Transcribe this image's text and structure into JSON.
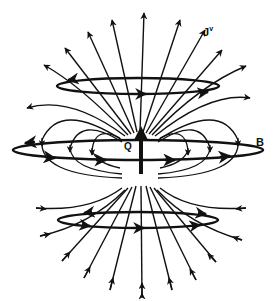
{
  "figure": {
    "type": "physics field diagram",
    "labels": {
      "current_density": "J",
      "current_density_superscript": "v",
      "magnetic_field": "B",
      "charge": "Q"
    },
    "colors": {
      "ink": "#111111",
      "background": "#ffffff"
    },
    "elements": {
      "central_ring": "horizontal ellipse around equator labeled B, with directional arrows",
      "upper_ring": "smaller horizontal ellipse above center with arrows",
      "lower_ring": "smaller horizontal ellipse below center with arrows",
      "charge_arrow": "thick upward arrow at center labeled Q",
      "top_lines": "radial field lines pointing outward from top (J^v)",
      "bottom_lines": "radial field lines pointing inward toward bottom",
      "side_loops": "curved loop field lines on left and right"
    }
  }
}
